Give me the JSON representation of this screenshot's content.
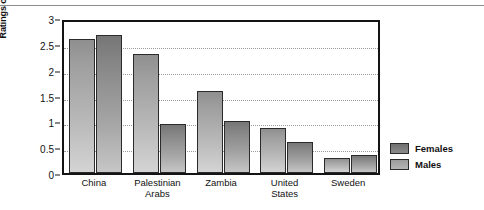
{
  "chart_data": {
    "type": "bar",
    "title": "",
    "xlabel": "",
    "ylabel": "Ratings of importance",
    "ylim": [
      0,
      3
    ],
    "yticks": [
      0,
      0.5,
      1,
      1.5,
      2,
      2.5,
      3
    ],
    "ytick_labels": [
      "0",
      "0.5",
      "1",
      "1.5",
      "2",
      "2.5",
      "3"
    ],
    "grid": "horizontal-dotted",
    "legend_position": "right",
    "categories": [
      "China",
      "Palestinian Arabs",
      "Zambia",
      "United States",
      "Sweden"
    ],
    "category_label_lines": [
      [
        "China"
      ],
      [
        "Palestinian",
        "Arabs"
      ],
      [
        "Zambia"
      ],
      [
        "United",
        "States"
      ],
      [
        "Sweden"
      ]
    ],
    "series": [
      {
        "name": "Females",
        "color": "#8f8f8f",
        "values": [
          2.6,
          2.3,
          1.58,
          0.87,
          0.3
        ]
      },
      {
        "name": "Males",
        "color": "#767676",
        "values": [
          2.67,
          0.95,
          1.0,
          0.6,
          0.34
        ]
      }
    ]
  },
  "legend": {
    "items": [
      {
        "label": "Females"
      },
      {
        "label": "Males"
      }
    ]
  },
  "axis": {
    "y_title": "Ratings of importance"
  }
}
